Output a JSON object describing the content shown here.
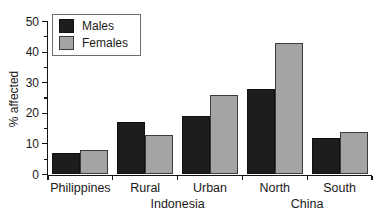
{
  "chart_data": {
    "type": "bar",
    "categories": [
      "Philippines",
      "Rural",
      "Urban",
      "North",
      "South"
    ],
    "series": [
      {
        "name": "Males",
        "color": "#1d1d1d",
        "border": "#111111",
        "values": [
          7,
          17,
          19,
          28,
          12
        ]
      },
      {
        "name": "Females",
        "color": "#a4a4a4",
        "border": "#3c3c3c",
        "values": [
          8,
          13,
          26,
          43,
          14
        ]
      }
    ],
    "group_labels": [
      {
        "label": "Indonesia",
        "between": [
          "Rural",
          "Urban"
        ]
      },
      {
        "label": "China",
        "between": [
          "North",
          "South"
        ]
      }
    ],
    "title": "",
    "xlabel": "",
    "ylabel": "% affected",
    "ylim": [
      0,
      50
    ],
    "ytick_step": 10,
    "yminor_step": 5,
    "grid": false,
    "legend_position": "top-left",
    "axis_color": "#141414",
    "background": "#ffffff"
  }
}
